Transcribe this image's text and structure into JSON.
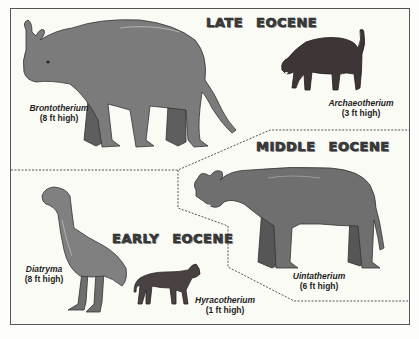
{
  "diagram": {
    "periods": [
      {
        "id": "late",
        "title": "LATE EOCENE"
      },
      {
        "id": "middle",
        "title": "MIDDLE EOCENE"
      },
      {
        "id": "early",
        "title": "EARLY EOCENE"
      }
    ],
    "animals": [
      {
        "id": "brontotherium",
        "name": "Brontotherium",
        "height": "(8 ft high)",
        "period": "late"
      },
      {
        "id": "archaeotherium",
        "name": "Archaeotherium",
        "height": "(3 ft high)",
        "period": "late"
      },
      {
        "id": "uintatherium",
        "name": "Uintatherium",
        "height": "(6 ft high)",
        "period": "middle"
      },
      {
        "id": "diatryma",
        "name": "Diatryma",
        "height": "(8 ft high)",
        "period": "early"
      },
      {
        "id": "hyracotherium",
        "name": "Hyracotherium",
        "height": "(1 ft high)",
        "period": "early"
      }
    ],
    "colors": {
      "background": "#fbfbf6",
      "border": "#555555",
      "heading": "#3e3e3e",
      "brontotherium": "#7b7b7b",
      "archaeotherium": "#3e3636",
      "uintatherium": "#6f6f6f",
      "diatryma": "#808080",
      "hyracotherium": "#4a4242"
    }
  }
}
